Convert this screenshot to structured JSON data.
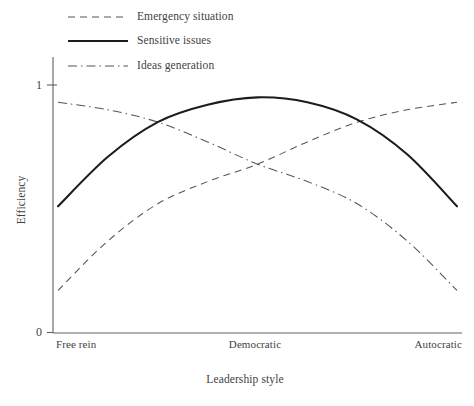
{
  "chart_data": {
    "type": "line",
    "title": "",
    "xlabel": "Leadership style",
    "ylabel": "Efficiency",
    "categories": [
      "Free rein",
      "Democratic",
      "Autocratic"
    ],
    "x": [
      0,
      0.5,
      1
    ],
    "ylim": [
      0,
      1
    ],
    "xlim": [
      0,
      1
    ],
    "y_ticks": [
      "0",
      "1"
    ],
    "y_tick_values": [
      0,
      1
    ],
    "grid": false,
    "legend_position": "top-left",
    "series": [
      {
        "name": "Emergency situation",
        "linestyle": "dashed",
        "color": "#555555",
        "linewidth": 1,
        "values": [
          0.17,
          0.66,
          0.93
        ],
        "points": [
          {
            "x": 0.0,
            "y": 0.17
          },
          {
            "x": 0.125,
            "y": 0.37
          },
          {
            "x": 0.25,
            "y": 0.52
          },
          {
            "x": 0.375,
            "y": 0.61
          },
          {
            "x": 0.5,
            "y": 0.68
          },
          {
            "x": 0.625,
            "y": 0.77
          },
          {
            "x": 0.75,
            "y": 0.85
          },
          {
            "x": 0.875,
            "y": 0.9
          },
          {
            "x": 1.0,
            "y": 0.93
          }
        ]
      },
      {
        "name": "Sensitive issues",
        "linestyle": "solid",
        "color": "#1c1c1c",
        "linewidth": 2,
        "values": [
          0.51,
          0.95,
          0.51
        ],
        "points": [
          {
            "x": 0.0,
            "y": 0.51
          },
          {
            "x": 0.125,
            "y": 0.71
          },
          {
            "x": 0.25,
            "y": 0.85
          },
          {
            "x": 0.375,
            "y": 0.92
          },
          {
            "x": 0.5,
            "y": 0.95
          },
          {
            "x": 0.625,
            "y": 0.93
          },
          {
            "x": 0.75,
            "y": 0.86
          },
          {
            "x": 0.875,
            "y": 0.72
          },
          {
            "x": 1.0,
            "y": 0.51
          }
        ]
      },
      {
        "name": "Ideas generation",
        "linestyle": "dash-dot",
        "color": "#555555",
        "linewidth": 1,
        "values": [
          0.93,
          0.66,
          0.17
        ],
        "points": [
          {
            "x": 0.0,
            "y": 0.93
          },
          {
            "x": 0.125,
            "y": 0.9
          },
          {
            "x": 0.25,
            "y": 0.85
          },
          {
            "x": 0.375,
            "y": 0.77
          },
          {
            "x": 0.5,
            "y": 0.68
          },
          {
            "x": 0.625,
            "y": 0.61
          },
          {
            "x": 0.75,
            "y": 0.52
          },
          {
            "x": 0.875,
            "y": 0.37
          },
          {
            "x": 1.0,
            "y": 0.17
          }
        ]
      }
    ],
    "annotations": []
  },
  "legend": {
    "entries": [
      {
        "label": "Emergency situation",
        "style": "dashed"
      },
      {
        "label": "Sensitive issues",
        "style": "solid"
      },
      {
        "label": "Ideas generation",
        "style": "dash-dot"
      }
    ]
  },
  "axes": {
    "y_title": "Efficiency",
    "x_title": "Leadership style",
    "y_tick_top": "1",
    "y_tick_bottom": "0",
    "x_tick_left": "Free rein",
    "x_tick_mid": "Democratic",
    "x_tick_right": "Autocratic"
  },
  "colors": {
    "background": "#ffffff",
    "axis": "#606060",
    "text": "#3f3f3f",
    "solid_line": "#1c1c1c",
    "thin_line": "#555555"
  }
}
